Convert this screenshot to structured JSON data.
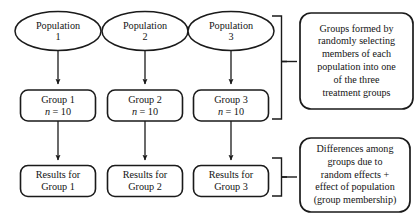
{
  "diagram": {
    "columns": [
      {
        "population": {
          "line1": "Population",
          "line2": "1"
        },
        "group": {
          "line1": "Group 1",
          "n_symbol": "n",
          "n_value": "= 10"
        },
        "results": {
          "line1": "Results for",
          "line2": "Group 1"
        }
      },
      {
        "population": {
          "line1": "Population",
          "line2": "2"
        },
        "group": {
          "line1": "Group 2",
          "n_symbol": "n",
          "n_value": "= 10"
        },
        "results": {
          "line1": "Results for",
          "line2": "Group 2"
        }
      },
      {
        "population": {
          "line1": "Population",
          "line2": "3"
        },
        "group": {
          "line1": "Group 3",
          "n_symbol": "n",
          "n_value": "= 10"
        },
        "results": {
          "line1": "Results for",
          "line2": "Group 3"
        }
      }
    ],
    "callouts": [
      {
        "id": "groups-formed",
        "lines": [
          "Groups formed by",
          "randomly selecting",
          "members of each",
          "population into one",
          "of the three",
          "treatment groups"
        ]
      },
      {
        "id": "differences-among",
        "lines": [
          "Differences among",
          "groups due to",
          "random effects +",
          "effect of population",
          "(group membership)"
        ]
      }
    ],
    "colors": {
      "stroke": "#1a1a1a",
      "text": "#141414",
      "background": "#ffffff"
    }
  }
}
